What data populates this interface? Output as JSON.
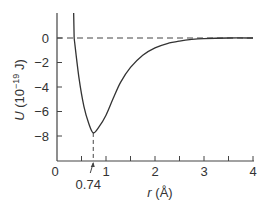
{
  "chart_data": {
    "type": "line",
    "title": "",
    "xlabel": "r (Å)",
    "ylabel": "U (10⁻¹⁹ J)",
    "xlim": [
      0,
      4
    ],
    "ylim": [
      -10,
      2
    ],
    "x_ticks": [
      "0",
      "1",
      "2",
      "3",
      "4"
    ],
    "y_ticks": [
      "0",
      "−2",
      "−4",
      "−6",
      "−8"
    ],
    "grid": false,
    "legend": null,
    "series": [
      {
        "name": "U(r)",
        "x": [
          0.35,
          0.45,
          0.55,
          0.65,
          0.74,
          0.85,
          1.0,
          1.15,
          1.3,
          1.5,
          1.75,
          2.0,
          2.25,
          2.5,
          2.75,
          3.0,
          3.5,
          4.0
        ],
        "y": [
          0.0,
          -3.3,
          -5.6,
          -7.0,
          -7.75,
          -7.3,
          -6.3,
          -4.9,
          -3.6,
          -2.4,
          -1.4,
          -0.8,
          -0.45,
          -0.25,
          -0.12,
          -0.05,
          0.0,
          0.0
        ]
      }
    ],
    "annotations": [
      {
        "text": "0.74",
        "x": 0.74,
        "note": "equilibrium separation, minimum of U"
      },
      {
        "text": "",
        "type": "dashed horizontal line",
        "y": 0
      },
      {
        "text": "",
        "type": "dashed vertical line",
        "x": 0.74
      }
    ],
    "minimum": {
      "x": 0.74,
      "y": -7.75
    }
  },
  "labels": {
    "x_axis": "r (Å)",
    "y_axis_prefix": "U (10",
    "y_axis_exp": "−19",
    "y_axis_suffix": " J)",
    "min_annotation": "0.74",
    "x_ticks": [
      "0",
      "1",
      "2",
      "3",
      "4"
    ],
    "y_ticks": [
      "0",
      "−2",
      "−4",
      "−6",
      "−8"
    ]
  }
}
